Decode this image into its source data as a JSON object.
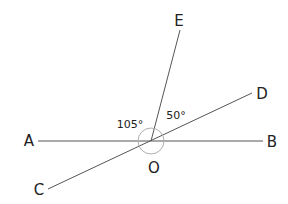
{
  "diagram": {
    "type": "geometry-angles",
    "vertex": "O",
    "points": [
      "A",
      "B",
      "C",
      "D",
      "E",
      "O"
    ],
    "lines": [
      {
        "name": "AB",
        "from": "A",
        "to": "B"
      },
      {
        "name": "CD",
        "from": "C",
        "to": "D"
      },
      {
        "name": "OE",
        "from": "O",
        "to": "E"
      }
    ],
    "angle_labels": [
      {
        "id": "angle-aoe",
        "text": "105°",
        "between": [
          "A",
          "E"
        ]
      },
      {
        "id": "angle-eod",
        "text": "50°",
        "between": [
          "E",
          "D"
        ]
      }
    ],
    "labels": {
      "A": "A",
      "B": "B",
      "C": "C",
      "D": "D",
      "E": "E",
      "O": "O"
    },
    "colors": {
      "line": "#555555",
      "arc": "#b0b0b0",
      "text": "#222222"
    }
  }
}
